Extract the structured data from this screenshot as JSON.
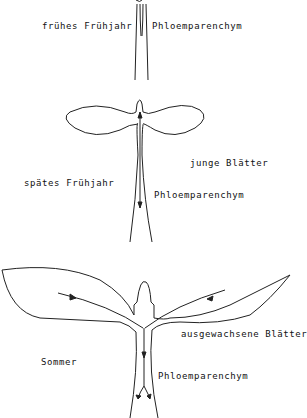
{
  "diagram": {
    "stages": [
      {
        "season": "frühes Frühjahr",
        "tissue": "Phloemparenchym"
      },
      {
        "season": "spätes Frühjahr",
        "leaves": "junge Blätter",
        "tissue": "Phloemparenchym"
      },
      {
        "season": "Sommer",
        "leaves": "ausgewachsene Blätter",
        "tissue": "Phloemparenchym"
      }
    ],
    "colors": {
      "line": "#222222",
      "background": "#ffffff"
    }
  }
}
